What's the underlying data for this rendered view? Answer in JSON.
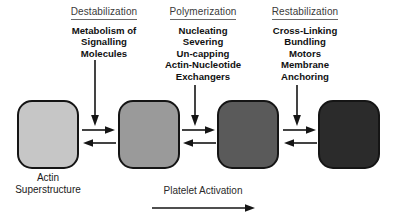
{
  "figure": {
    "background_color": "#ffffff"
  },
  "columns": [
    {
      "header": "Destabilization",
      "lines": [
        "Metabolism of",
        "Signalling",
        "Molecules"
      ],
      "arrow": "down-arrow"
    },
    {
      "header": "Polymerization",
      "lines": [
        "Nucleating",
        "Severing",
        "Un-capping",
        "Actin-Nucleotide",
        "Exchangers"
      ],
      "arrow": "down-arrow"
    },
    {
      "header": "Restabilization",
      "lines": [
        "Cross-Linking",
        "Bundling",
        "Motors",
        "Membrane",
        "Anchoring"
      ],
      "arrow": "down-arrow"
    }
  ],
  "nodes": [
    {
      "name": "state-1",
      "fill": "#c6c6c6"
    },
    {
      "name": "state-2",
      "fill": "#9a9a9a"
    },
    {
      "name": "state-3",
      "fill": "#5a5a5a"
    },
    {
      "name": "state-4",
      "fill": "#2b2b2b"
    }
  ],
  "connectors": [
    {
      "name": "reversible-arrows-1",
      "forward": "right-arrow",
      "reverse": "left-arrow"
    },
    {
      "name": "reversible-arrows-2",
      "forward": "right-arrow",
      "reverse": "left-arrow"
    },
    {
      "name": "reversible-arrows-3",
      "forward": "right-arrow",
      "reverse": "left-arrow"
    }
  ],
  "captions": {
    "actin_superstructure": [
      "Actin",
      "Superstructure"
    ],
    "process": "Platelet Activation"
  },
  "colors": {
    "stroke": "#151515",
    "header_rule": "#6a6a6a",
    "text": "#1a1a1a"
  }
}
